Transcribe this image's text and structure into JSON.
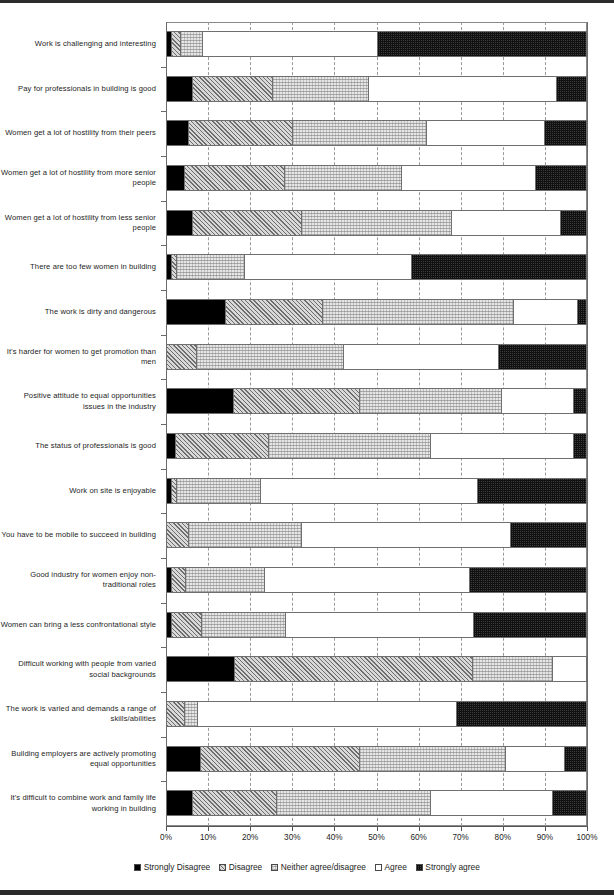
{
  "chart_data": {
    "type": "bar",
    "orientation": "horizontal",
    "stacked": true,
    "stack_normalized": true,
    "title": "",
    "xlabel": "",
    "ylabel": "",
    "xlim": [
      0,
      100
    ],
    "grid": true,
    "legend_position": "bottom",
    "xticklabels": [
      "0%",
      "10%",
      "20%",
      "30%",
      "40%",
      "50%",
      "60%",
      "70%",
      "80%",
      "90%",
      "100%"
    ],
    "xticks": [
      0,
      10,
      20,
      30,
      40,
      50,
      60,
      70,
      80,
      90,
      100
    ],
    "legend": [
      "Strongly Disagree",
      "Disagree",
      "Neither agree/disagree",
      "Agree",
      "Strongly agree"
    ],
    "categories": [
      "Work is challenging and interesting",
      "Pay for professionals in building is good",
      "Women get a lot of hostility from their peers",
      "Women get a lot of hostility from more senior people",
      "Women get a lot of hostility from less senior people",
      "There are too few women in building",
      "The work is dirty and dangerous",
      "It's harder for women to get promotion than men",
      "Positive attitude to equal opportunities issues in the industry",
      "The status of professionals is good",
      "Work on site is enjoyable",
      "You have to be mobile to succeed in building",
      "Good industry for women enjoy non-traditional roles",
      "Women can bring a less confrontational style",
      "Difficult working with people from varied social backgrounds",
      "The work is varied and demands a range of skills/abilities",
      "Building employers are actively promoting equal opportunities",
      "It's difficult to combine work and family life working in building"
    ],
    "series": [
      {
        "name": "Strongly Disagree",
        "values": [
          1,
          6,
          5,
          4,
          6,
          1,
          14,
          0,
          16,
          2,
          1,
          0,
          1,
          1,
          16,
          0,
          8,
          6
        ]
      },
      {
        "name": "Disagree",
        "values": [
          2,
          19,
          25,
          24,
          26,
          1,
          23,
          7,
          30,
          22,
          1,
          5,
          3,
          7,
          57,
          4,
          38,
          20
        ]
      },
      {
        "name": "Neither agree/disagree",
        "values": [
          5,
          23,
          32,
          28,
          36,
          16,
          46,
          35,
          34,
          39,
          20,
          27,
          19,
          20,
          19,
          3,
          35,
          37
        ]
      },
      {
        "name": "Agree",
        "values": [
          42,
          45,
          28,
          32,
          26,
          40,
          15,
          37,
          17,
          34,
          52,
          50,
          49,
          45,
          8,
          62,
          14,
          29
        ]
      },
      {
        "name": "Strongly agree",
        "values": [
          50,
          7,
          10,
          12,
          6,
          42,
          2,
          21,
          3,
          3,
          26,
          18,
          28,
          27,
          0,
          31,
          5,
          8
        ]
      }
    ]
  }
}
